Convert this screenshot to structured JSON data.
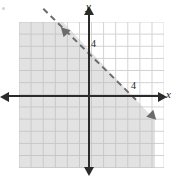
{
  "figure": {
    "title": ""
  },
  "axes": {
    "x_label": "x",
    "y_label": "y",
    "x_arrow_left": "arrow-left",
    "x_arrow_right": "arrow-right",
    "y_arrow_up": "arrow-up",
    "y_arrow_down": "arrow-down"
  },
  "ticks": {
    "y_tick_label": "4",
    "x_tick_label": "4"
  },
  "chart_data": {
    "type": "line",
    "title": "",
    "xlabel": "x",
    "ylabel": "y",
    "xlim": [
      -6,
      6
    ],
    "ylim": [
      -6,
      6
    ],
    "grid": true,
    "legend": "none",
    "tick_labels": {
      "x": [
        "4"
      ],
      "y": [
        "4"
      ]
    },
    "annotations": [
      {
        "kind": "boundary-line",
        "style": "dashed",
        "arrows": "both",
        "slope": -1,
        "y_intercept": 4,
        "x_intercept": 4,
        "equation": "x + y = 4",
        "points": [
          [
            -2,
            6
          ],
          [
            4,
            0
          ],
          [
            6,
            -2
          ]
        ],
        "color": "#6b6b6b"
      },
      {
        "kind": "shaded-region",
        "inequality": "x + y < 4",
        "side": "below-left",
        "color": "#b9b9b9",
        "opacity": 0.42
      }
    ],
    "series": [
      {
        "name": "x + y = 4",
        "x": [
          -2,
          0,
          4,
          6
        ],
        "y": [
          6,
          4,
          0,
          -2
        ],
        "dashed": true
      }
    ]
  },
  "colors": {
    "axis": "#2b2b2b",
    "grid": "#c9c9c9",
    "boundary": "#6b6b6b",
    "shade": "#b9b9b9",
    "background": "#ffffff"
  }
}
